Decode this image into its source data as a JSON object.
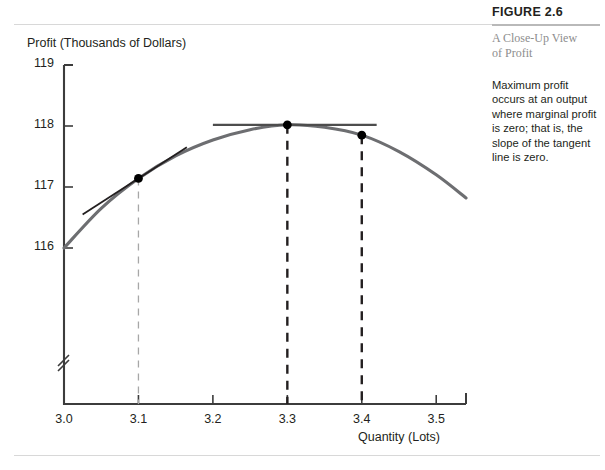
{
  "figure": {
    "label": "FIGURE 2.6",
    "caption_title_line1": "A Close-Up View",
    "caption_title_line2": "of Profit",
    "caption_body": "Maximum profit occurs at an output where marginal profit is zero; that is, the slope of the tangent line is zero."
  },
  "chart_data": {
    "type": "line",
    "title": "",
    "xlabel": "Quantity (Lots)",
    "ylabel": "Profit (Thousands of Dollars)",
    "xlim": [
      3.0,
      3.54
    ],
    "ylim": [
      115.72,
      119.0
    ],
    "grid": false,
    "legend": "none",
    "axis_break_y": true,
    "xticks": [
      3.0,
      3.1,
      3.2,
      3.3,
      3.4,
      3.5
    ],
    "xtick_labels": [
      "3.0",
      "3.1",
      "3.2",
      "3.3",
      "3.4",
      "3.5"
    ],
    "yticks": [
      116,
      117,
      118,
      119
    ],
    "ytick_labels": [
      "116",
      "117",
      "118",
      "119"
    ],
    "series": [
      {
        "name": "Profit curve",
        "type": "curve",
        "color": "#6d6e71",
        "points": [
          {
            "x": 3.0,
            "y": 116.0
          },
          {
            "x": 3.05,
            "y": 116.65
          },
          {
            "x": 3.1,
            "y": 117.14
          },
          {
            "x": 3.15,
            "y": 117.51
          },
          {
            "x": 3.2,
            "y": 117.77
          },
          {
            "x": 3.25,
            "y": 117.94
          },
          {
            "x": 3.3,
            "y": 118.02
          },
          {
            "x": 3.35,
            "y": 117.98
          },
          {
            "x": 3.4,
            "y": 117.85
          },
          {
            "x": 3.45,
            "y": 117.58
          },
          {
            "x": 3.5,
            "y": 117.2
          },
          {
            "x": 3.54,
            "y": 116.82
          }
        ]
      },
      {
        "name": "Tangent line at Q = 3.1",
        "type": "tangent",
        "color": "#231f20",
        "x_at": 3.1,
        "y_at": 117.14,
        "slope": 7.9,
        "x_from": 3.025,
        "x_to": 3.165
      },
      {
        "name": "Tangent line at maximum (Q = 3.3)",
        "type": "tangent",
        "color": "#4d4d4d",
        "x_at": 3.3,
        "y_at": 118.02,
        "slope": 0,
        "x_from": 3.2,
        "x_to": 3.42
      }
    ],
    "markers": [
      {
        "label": "Point at Q = 3.1",
        "x": 3.1,
        "y": 117.14
      },
      {
        "label": "Maximum profit point at Q = 3.3",
        "x": 3.3,
        "y": 118.02
      },
      {
        "label": "Point at Q = 3.4",
        "x": 3.4,
        "y": 117.85
      }
    ],
    "droplines": [
      {
        "label": "Dropline at Q = 3.1",
        "x": 3.1,
        "y_top": 117.14,
        "style": "dashed-light"
      },
      {
        "label": "Dropline at Q = 3.3",
        "x": 3.3,
        "y_top": 118.02,
        "style": "dashed-dark"
      },
      {
        "label": "Dropline at Q = 3.4",
        "x": 3.4,
        "y_top": 117.85,
        "style": "dashed-dark"
      }
    ]
  }
}
